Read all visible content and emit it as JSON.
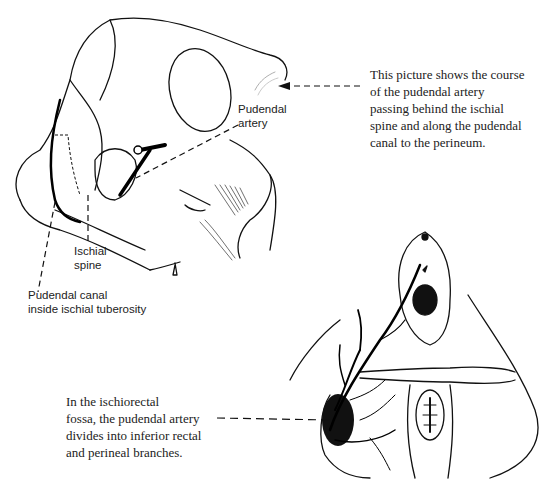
{
  "figure": {
    "top_illustration": "pelvis-lateral-view",
    "bottom_illustration": "perineum-inferior-view"
  },
  "labels": {
    "pudendal_artery": [
      "Pudendal",
      "artery"
    ],
    "ischial_spine": [
      "Ischial",
      "spine"
    ],
    "pudendal_canal": [
      "Pudendal canal",
      "inside ischial tuberosity"
    ]
  },
  "captions": {
    "top": [
      "This picture shows the course",
      "of the pudendal artery",
      "passing behind the ischial",
      "spine and along the pudendal",
      "canal to the perineum."
    ],
    "bottom": [
      "In the ischiorectal",
      "fossa, the pudendal artery",
      "divides into inferior rectal",
      "and perineal branches."
    ]
  }
}
